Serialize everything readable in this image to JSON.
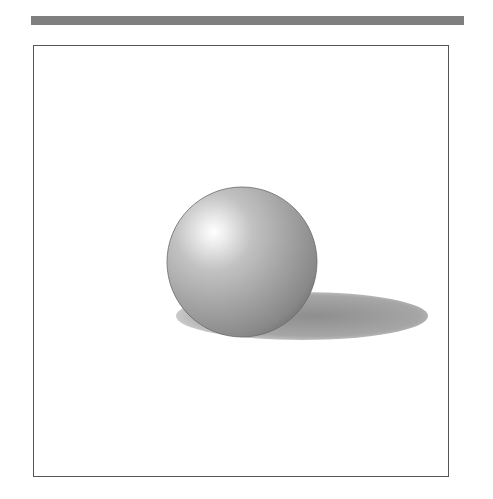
{
  "illustration": {
    "subject": "shaded sphere with cast shadow",
    "colors": {
      "top_bar": "#7f7f7f",
      "frame_border": "#555555",
      "sphere_highlight": "#ffffff",
      "sphere_mid": "#a8a8a8",
      "sphere_dark": "#6e6e6e",
      "shadow": "#9a9a9a"
    }
  }
}
